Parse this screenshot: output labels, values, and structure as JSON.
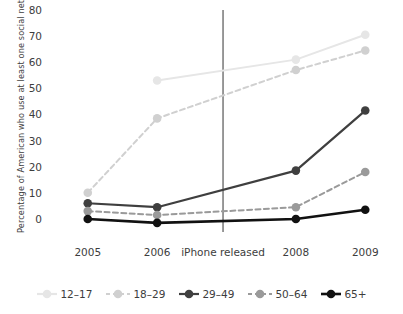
{
  "chart_data": {
    "type": "line",
    "title": "",
    "xlabel": "",
    "ylabel": "Percentage of American who use at least one social networking site",
    "categories": [
      "2005",
      "2006",
      "2008",
      "2009"
    ],
    "x": [
      2005,
      2006,
      2008,
      2009
    ],
    "ylim": [
      -5,
      80
    ],
    "xlim": [
      2004.6,
      2009.4
    ],
    "yticks": [
      0,
      10,
      20,
      30,
      40,
      50,
      60,
      70,
      80
    ],
    "ytick_labels": [
      "0",
      "10",
      "20",
      "30",
      "40",
      "50",
      "60",
      "70",
      "80"
    ],
    "xtick_labels": [
      "2005",
      "2006",
      "2008",
      "2009"
    ],
    "grid": false,
    "legend_position": "bottom",
    "annotations": [
      {
        "name": "iphone-released",
        "label": "iPhone released",
        "type": "vertical-line",
        "x": 2006.95,
        "y_top": 80,
        "y_bottom": -5,
        "color": "#555555"
      }
    ],
    "series": [
      {
        "name": "12–17",
        "color": "#e6e6e6",
        "linestyle": "solid",
        "marker": "circle",
        "x": [
          2006,
          2008,
          2009
        ],
        "values": [
          53,
          61,
          70.5
        ]
      },
      {
        "name": "18–29",
        "color": "#d0d0d0",
        "linestyle": "dashed",
        "marker": "circle",
        "x": [
          2005,
          2006,
          2008,
          2009
        ],
        "values": [
          10,
          38.5,
          57,
          64.5
        ]
      },
      {
        "name": "29–49",
        "color": "#3f3f3f",
        "linestyle": "solid",
        "marker": "circle",
        "x": [
          2005,
          2006,
          2008,
          2009
        ],
        "values": [
          6,
          4.5,
          18.5,
          41.5
        ]
      },
      {
        "name": "50–64",
        "color": "#9a9a9a",
        "linestyle": "dashed",
        "marker": "circle",
        "x": [
          2005,
          2006,
          2008,
          2009
        ],
        "values": [
          3,
          1.5,
          4.5,
          18
        ]
      },
      {
        "name": "65+",
        "color": "#111111",
        "linestyle": "solid",
        "marker": "circle",
        "x": [
          2005,
          2006,
          2008,
          2009
        ],
        "values": [
          0,
          -1.5,
          0,
          3.5
        ]
      }
    ]
  }
}
